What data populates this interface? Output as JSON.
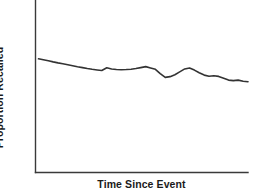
{
  "chart_data": {
    "type": "line",
    "title": "",
    "subtitle": "",
    "xlabel": "Time Since Event",
    "ylabel": "Proportion Recalled",
    "grid": false,
    "legend": null,
    "legend_position": "none",
    "xticks": [],
    "yticks": [],
    "xtick_labels": [],
    "ytick_labels": [],
    "xlim": [
      0,
      100
    ],
    "ylim": [
      0,
      100
    ],
    "annotations": [],
    "line_color": "#333333",
    "axis_color": "#3a3a3a",
    "background_color": "#ffffff",
    "series": [
      {
        "name": "Proportion Recalled",
        "color": "#333333",
        "x": [
          0.0,
          2.3,
          4.7,
          7.0,
          9.3,
          11.6,
          14.0,
          16.3,
          18.6,
          21.0,
          23.3,
          25.6,
          28.0,
          30.2,
          32.6,
          34.9,
          37.2,
          39.5,
          41.9,
          44.2,
          46.5,
          48.8,
          51.2,
          53.5,
          55.8,
          58.1,
          60.5,
          62.8,
          65.1,
          67.4,
          69.8,
          72.1,
          74.4,
          76.7,
          79.1,
          81.4,
          83.7,
          86.0,
          88.4,
          90.7,
          93.0,
          95.3,
          97.7,
          100.0
        ],
        "y": [
          88.5,
          87.8,
          87.0,
          86.1,
          85.3,
          84.6,
          83.8,
          83.1,
          82.3,
          81.6,
          80.9,
          80.3,
          79.8,
          79.4,
          81.5,
          80.6,
          80.2,
          80.0,
          80.1,
          80.4,
          80.9,
          81.6,
          82.4,
          81.4,
          80.3,
          77.0,
          74.0,
          74.6,
          76.1,
          78.3,
          80.6,
          81.3,
          79.7,
          77.6,
          75.8,
          74.9,
          75.3,
          74.8,
          73.4,
          71.9,
          71.5,
          71.9,
          71.0,
          70.6
        ]
      }
    ]
  },
  "axes": {
    "y_axis_name": "y-axis",
    "x_axis_name": "x-axis"
  }
}
